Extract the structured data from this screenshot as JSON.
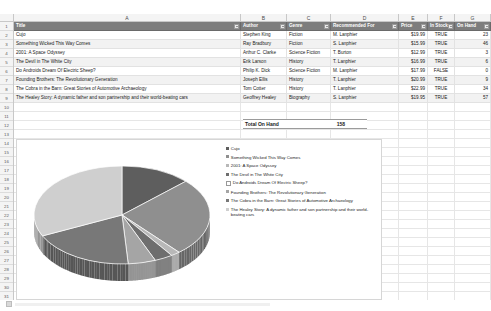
{
  "app": {
    "type": "spreadsheet"
  },
  "columns": {
    "letters": [
      "A",
      "B",
      "C",
      "D",
      "E",
      "F",
      "G"
    ]
  },
  "row_numbers": [
    1,
    2,
    3,
    4,
    5,
    6,
    7,
    8,
    9,
    10,
    11,
    12,
    13,
    14,
    15,
    16,
    17,
    18,
    19,
    20,
    21,
    22,
    23,
    24,
    25,
    26,
    27,
    28,
    29,
    30,
    31,
    32
  ],
  "table": {
    "headers": {
      "title": "Title",
      "author": "Author",
      "genre": "Genre",
      "recommended_for": "Recommended For",
      "price": "Price",
      "in_stock": "In Stock",
      "on_hand": "On Hand"
    },
    "rows": [
      {
        "title": "Cujo",
        "author": "Stephen King",
        "genre": "Fiction",
        "recommended_for": "M. Lanphier",
        "price": "$19.99",
        "in_stock": "TRUE",
        "on_hand": "23"
      },
      {
        "title": "Something Wicked This Way Comes",
        "author": "Ray Bradbury",
        "genre": "Fiction",
        "recommended_for": "S. Lanphier",
        "price": "$15.99",
        "in_stock": "TRUE",
        "on_hand": "46"
      },
      {
        "title": "2001: A Space Odyssey",
        "author": "Arthur C. Clarke",
        "genre": "Science Fiction",
        "recommended_for": "T. Burton",
        "price": "$12.99",
        "in_stock": "TRUE",
        "on_hand": "3"
      },
      {
        "title": "The Devil in The White City",
        "author": "Erik Larson",
        "genre": "History",
        "recommended_for": "T. Lanphier",
        "price": "$16.99",
        "in_stock": "TRUE",
        "on_hand": "6"
      },
      {
        "title": "Do Androids Dream Of Electric Sheep?",
        "author": "Philip K. Dick",
        "genre": "Science Fiction",
        "recommended_for": "M. Lanphier",
        "price": "$17.99",
        "in_stock": "FALSE",
        "on_hand": "0"
      },
      {
        "title": "Founding Brothers: The Revolutionary Generation",
        "author": "Joseph Ellis",
        "genre": "History",
        "recommended_for": "T. Lanphier",
        "price": "$20.99",
        "in_stock": "TRUE",
        "on_hand": "9"
      },
      {
        "title": "The Cobra in the Barn: Great Stories of Automotive Archaeology",
        "author": "Tom Cotter",
        "genre": "History",
        "recommended_for": "T. Lanphier",
        "price": "$22.99",
        "in_stock": "TRUE",
        "on_hand": "34"
      },
      {
        "title": "The Healey Story: A dynamic father and son partnership and their world-beating cars",
        "author": "Geoffrey Healey",
        "genre": "Biography",
        "recommended_for": "S. Lanphier",
        "price": "$19.95",
        "in_stock": "TRUE",
        "on_hand": "57"
      }
    ]
  },
  "total": {
    "label": "Total On Hand",
    "value": "158"
  },
  "chart_data": {
    "type": "pie",
    "title": "",
    "labels": [
      "Cujo",
      "Something Wicked This Way Comes",
      "2001: A Space Odyssey",
      "The Devil in The White City",
      "Do Androids Dream Of Electric Sheep?",
      "Founding Brothers: The Revolutionary Generation",
      "The Cobra in the Barn: Great Stories of Automotive Archaeology",
      "The Healey Story: A dynamic father and son partnership and their world-beating cars"
    ],
    "values": [
      23,
      46,
      3,
      6,
      0,
      9,
      34,
      57
    ],
    "total": 158,
    "colors": [
      "#5e5e5e",
      "#8f8f8f",
      "#b8b8b8",
      "#6e6e6e",
      "#ffffff",
      "#a5a5a5",
      "#787878",
      "#cfcfcf"
    ],
    "legend_position": "right",
    "three_d": true
  }
}
